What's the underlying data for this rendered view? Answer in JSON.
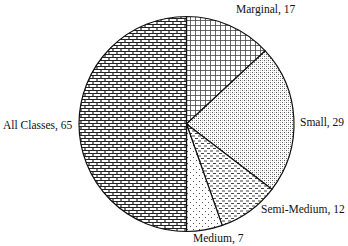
{
  "chart_data": {
    "type": "pie",
    "title": "",
    "start_angle": "12 o'clock, clockwise",
    "categories": [
      "Marginal",
      "Small",
      "Semi-Medium",
      "Medium",
      "All Classes"
    ],
    "values": [
      17,
      29,
      12,
      7,
      65
    ],
    "labels": [
      "Marginal, 17",
      "Small, 29",
      "Semi-Medium, 12",
      "Medium, 7",
      "All Classes, 65"
    ],
    "patterns": [
      "grid",
      "dotted-crosshatch",
      "dashed-horizontal",
      "sparse-dots",
      "brick"
    ],
    "legend": "none (labels outside slices)"
  }
}
